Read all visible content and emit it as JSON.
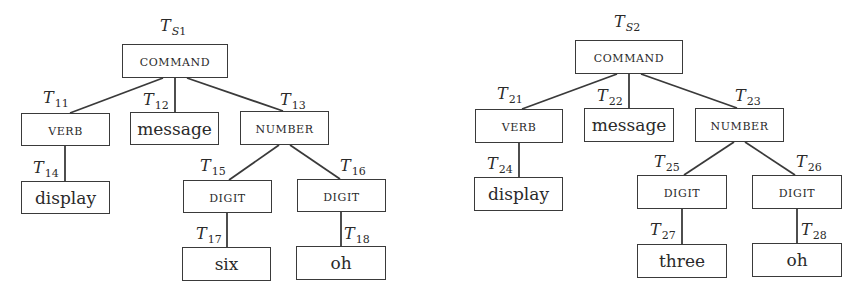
{
  "trees": [
    {
      "root_label": {
        "main": "T",
        "sub_letter": "S",
        "sub_num": "1"
      },
      "nodes": [
        {
          "id": "cmd",
          "text": "COMMAND",
          "kind": "category",
          "x": 122,
          "y": 44,
          "w": 106,
          "h": 34,
          "label": null
        },
        {
          "id": "verb",
          "text": "VERB",
          "kind": "category",
          "x": 21,
          "y": 113,
          "w": 89,
          "h": 33,
          "label": "11"
        },
        {
          "id": "msg",
          "text": "message",
          "kind": "lexical",
          "x": 130,
          "y": 112,
          "w": 89,
          "h": 33,
          "label": "12"
        },
        {
          "id": "num",
          "text": "NUMBER",
          "kind": "category",
          "x": 240,
          "y": 111,
          "w": 89,
          "h": 34,
          "label": "13"
        },
        {
          "id": "disp",
          "text": "display",
          "kind": "lexical",
          "x": 21,
          "y": 181,
          "w": 89,
          "h": 33,
          "label": "14"
        },
        {
          "id": "dig1",
          "text": "DIGIT",
          "kind": "category",
          "x": 183,
          "y": 180,
          "w": 89,
          "h": 33,
          "label": "15"
        },
        {
          "id": "dig2",
          "text": "DIGIT",
          "kind": "category",
          "x": 297,
          "y": 179,
          "w": 89,
          "h": 33,
          "label": "16"
        },
        {
          "id": "w1",
          "text": "six",
          "kind": "lexical",
          "x": 182,
          "y": 247,
          "w": 89,
          "h": 34,
          "label": "17"
        },
        {
          "id": "w2",
          "text": "oh",
          "kind": "lexical",
          "x": 296,
          "y": 246,
          "w": 90,
          "h": 34,
          "label": "18"
        }
      ],
      "labels": {
        "root": {
          "x": 160,
          "y": 16
        },
        "11": {
          "x": 43,
          "y": 88
        },
        "12": {
          "x": 143,
          "y": 90
        },
        "13": {
          "x": 280,
          "y": 90
        },
        "14": {
          "x": 33,
          "y": 158
        },
        "15": {
          "x": 200,
          "y": 156
        },
        "16": {
          "x": 340,
          "y": 156
        },
        "17": {
          "x": 196,
          "y": 224
        },
        "18": {
          "x": 344,
          "y": 224
        }
      },
      "edges": [
        [
          "cmd",
          "verb",
          163,
          78,
          70,
          113
        ],
        [
          "cmd",
          "msg",
          175,
          78,
          175,
          112
        ],
        [
          "cmd",
          "num",
          187,
          78,
          283,
          111
        ],
        [
          "verb",
          "disp",
          65,
          146,
          65,
          181
        ],
        [
          "num",
          "dig1",
          279,
          145,
          229,
          180
        ],
        [
          "num",
          "dig2",
          290,
          145,
          340,
          179
        ],
        [
          "dig1",
          "w1",
          227,
          213,
          227,
          247
        ],
        [
          "dig2",
          "w2",
          341,
          212,
          341,
          246
        ]
      ]
    },
    {
      "root_label": {
        "main": "T",
        "sub_letter": "S",
        "sub_num": "2"
      },
      "nodes": [
        {
          "id": "cmd",
          "text": "COMMAND",
          "kind": "category",
          "x": 575,
          "y": 40,
          "w": 108,
          "h": 34,
          "label": null
        },
        {
          "id": "verb",
          "text": "VERB",
          "kind": "category",
          "x": 475,
          "y": 109,
          "w": 88,
          "h": 34,
          "label": "21"
        },
        {
          "id": "msg",
          "text": "message",
          "kind": "lexical",
          "x": 584,
          "y": 108,
          "w": 90,
          "h": 34,
          "label": "22"
        },
        {
          "id": "num",
          "text": "NUMBER",
          "kind": "category",
          "x": 695,
          "y": 108,
          "w": 89,
          "h": 34,
          "label": "23"
        },
        {
          "id": "disp",
          "text": "display",
          "kind": "lexical",
          "x": 474,
          "y": 177,
          "w": 89,
          "h": 34,
          "label": "24"
        },
        {
          "id": "dig1",
          "text": "DIGIT",
          "kind": "category",
          "x": 637,
          "y": 175,
          "w": 90,
          "h": 34,
          "label": "25"
        },
        {
          "id": "dig2",
          "text": "DIGIT",
          "kind": "category",
          "x": 752,
          "y": 175,
          "w": 90,
          "h": 34,
          "label": "26"
        },
        {
          "id": "w1",
          "text": "three",
          "kind": "lexical",
          "x": 637,
          "y": 244,
          "w": 90,
          "h": 34,
          "label": "27"
        },
        {
          "id": "w2",
          "text": "oh",
          "kind": "lexical",
          "x": 752,
          "y": 243,
          "w": 90,
          "h": 34,
          "label": "28"
        }
      ],
      "labels": {
        "root": {
          "x": 614,
          "y": 12
        },
        "21": {
          "x": 497,
          "y": 84
        },
        "22": {
          "x": 597,
          "y": 86
        },
        "23": {
          "x": 735,
          "y": 86
        },
        "24": {
          "x": 487,
          "y": 154
        },
        "25": {
          "x": 654,
          "y": 152
        },
        "26": {
          "x": 796,
          "y": 152
        },
        "27": {
          "x": 650,
          "y": 220
        },
        "28": {
          "x": 801,
          "y": 220
        }
      },
      "edges": [
        [
          "cmd",
          "verb",
          617,
          74,
          522,
          109
        ],
        [
          "cmd",
          "msg",
          629,
          74,
          629,
          108
        ],
        [
          "cmd",
          "num",
          641,
          74,
          737,
          108
        ],
        [
          "verb",
          "disp",
          519,
          143,
          519,
          177
        ],
        [
          "num",
          "dig1",
          734,
          142,
          684,
          175
        ],
        [
          "num",
          "dig2",
          745,
          142,
          795,
          175
        ],
        [
          "dig1",
          "w1",
          682,
          209,
          682,
          244
        ],
        [
          "dig2",
          "w2",
          797,
          209,
          797,
          243
        ]
      ]
    }
  ],
  "colors": {
    "stroke": "#3a3a3a",
    "text": "#2a2a2a",
    "background": "#ffffff"
  }
}
